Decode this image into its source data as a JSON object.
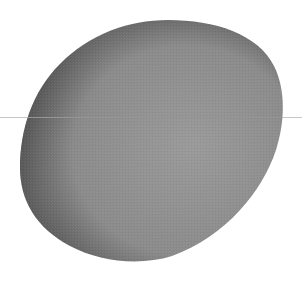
{
  "scene": {
    "width": 302,
    "height": 286,
    "background": "#ffffff",
    "blob": {
      "fill": "#8b8b8b",
      "rim_shade": "#4a4a4a",
      "highlight": "#9a9a9a",
      "bounds": {
        "left": 20,
        "top": 20,
        "right": 282,
        "bottom": 262
      }
    },
    "horizontal_line": {
      "y": 117.5,
      "color": "#c6c6c6",
      "color_over_blob": "#707070",
      "thickness": 1
    }
  }
}
